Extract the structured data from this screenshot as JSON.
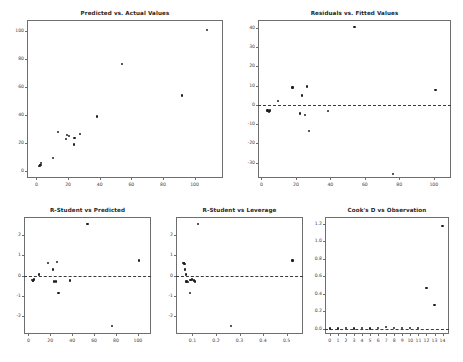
{
  "figure": {
    "background": "#ffffff",
    "marker_color": "#1f1f1f",
    "axis_color": "#6e6e6e",
    "refline_color": "#3a3a3a"
  },
  "chart_data": [
    {
      "id": "predicted-vs-actual",
      "type": "scatter",
      "title": "Predicted vs. Actual Values",
      "xlabel": "",
      "ylabel": "",
      "xlim": [
        -6,
        118
      ],
      "ylim": [
        -5,
        108
      ],
      "grid": false,
      "legend": null,
      "xticks": [
        0,
        20,
        40,
        60,
        80,
        100
      ],
      "yticks": [
        0,
        20,
        40,
        60,
        80,
        100
      ],
      "xticklabels": [
        "0",
        "20",
        "40",
        "60",
        "80",
        "100"
      ],
      "yticklabels": [
        "0",
        "20",
        "40",
        "60",
        "80",
        "100"
      ],
      "reference_line": null,
      "x": [
        1.5,
        2.0,
        2.5,
        3.0,
        10.5,
        13.5,
        18.5,
        19.5,
        20.5,
        23.5,
        24.0,
        27.5,
        38.5,
        54.0,
        92.0,
        108.0
      ],
      "y": [
        3.5,
        4.0,
        4.5,
        5.5,
        9.5,
        28.0,
        23.0,
        25.5,
        25.0,
        19.0,
        23.5,
        26.5,
        39.0,
        76.5,
        54.0,
        101.0
      ]
    },
    {
      "id": "residuals-vs-fitted",
      "type": "scatter",
      "title": "Residuals vs. Fitted Values",
      "xlabel": "",
      "ylabel": "",
      "xlim": [
        -2,
        110
      ],
      "ylim": [
        -38,
        44
      ],
      "grid": false,
      "legend": null,
      "xticks": [
        0,
        20,
        40,
        60,
        80,
        100
      ],
      "yticks": [
        -30,
        -20,
        -10,
        0,
        10,
        20,
        30,
        40
      ],
      "xticklabels": [
        "0",
        "20",
        "40",
        "60",
        "80",
        "100"
      ],
      "yticklabels": [
        "-30",
        "-20",
        "-10",
        "0",
        "10",
        "20",
        "30",
        "40"
      ],
      "reference_line": 0,
      "x": [
        3.5,
        4.0,
        4.5,
        5.0,
        9.5,
        18.0,
        22.5,
        23.5,
        25.5,
        26.5,
        27.5,
        38.5,
        54.0,
        76.5,
        101.0
      ],
      "y": [
        -3.0,
        -3.2,
        -3.5,
        -3.0,
        2.0,
        9.0,
        -4.5,
        4.8,
        -5.2,
        9.5,
        -13.5,
        -3.2,
        40.2,
        -36.0,
        7.8
      ]
    },
    {
      "id": "rstudent-vs-predicted",
      "type": "scatter",
      "title": "R-Student vs Predicted",
      "xlabel": "",
      "ylabel": "",
      "xlim": [
        -4,
        112
      ],
      "ylim": [
        -2.9,
        2.9
      ],
      "grid": false,
      "legend": null,
      "xticks": [
        0,
        20,
        40,
        60,
        80,
        100
      ],
      "yticks": [
        -2,
        -1,
        0,
        1,
        2
      ],
      "xticklabels": [
        "0",
        "20",
        "40",
        "60",
        "80",
        "100"
      ],
      "yticklabels": [
        "-2",
        "-1",
        "0",
        "1",
        "2"
      ],
      "reference_line": 0,
      "x": [
        3.5,
        4.0,
        4.5,
        5.5,
        9.5,
        18.0,
        22.5,
        23.5,
        25.0,
        26.5,
        27.5,
        38.0,
        54.0,
        76.5,
        101.0
      ],
      "y": [
        -0.22,
        -0.25,
        -0.28,
        -0.2,
        0.05,
        0.6,
        0.3,
        -0.3,
        -0.3,
        0.66,
        -0.88,
        -0.25,
        2.55,
        -2.5,
        0.74
      ]
    },
    {
      "id": "rstudent-vs-leverage",
      "type": "scatter",
      "title": "R-Student vs Leverage",
      "xlabel": "",
      "ylabel": "",
      "xlim": [
        0.03,
        0.57
      ],
      "ylim": [
        -2.9,
        2.9
      ],
      "grid": false,
      "legend": null,
      "xticks": [
        0.1,
        0.2,
        0.3,
        0.4,
        0.5
      ],
      "yticks": [
        -2,
        -1,
        0,
        1,
        2
      ],
      "xticklabels": [
        "0.1",
        "0.2",
        "0.3",
        "0.4",
        "0.5"
      ],
      "yticklabels": [
        "-2",
        "-1",
        "0",
        "1",
        "2"
      ],
      "reference_line": 0,
      "x": [
        0.062,
        0.064,
        0.066,
        0.068,
        0.072,
        0.075,
        0.082,
        0.088,
        0.092,
        0.098,
        0.105,
        0.112,
        0.122,
        0.265,
        0.525
      ],
      "y": [
        0.62,
        0.6,
        0.58,
        0.3,
        0.05,
        -0.3,
        -0.32,
        -0.88,
        -0.22,
        -0.2,
        -0.25,
        -0.3,
        2.55,
        -2.5,
        0.74
      ]
    },
    {
      "id": "cooks-d-vs-observation",
      "type": "scatter",
      "title": "Cook's D vs Observation",
      "xlabel": "",
      "ylabel": "",
      "xlim": [
        -0.6,
        14.8
      ],
      "ylim": [
        -0.06,
        1.28
      ],
      "grid": false,
      "legend": null,
      "xticks": [
        0,
        1,
        2,
        3,
        4,
        5,
        6,
        7,
        8,
        9,
        10,
        11,
        12,
        13,
        14
      ],
      "yticks": [
        0.0,
        0.2,
        0.4,
        0.6,
        0.8,
        1.0,
        1.2
      ],
      "xticklabels": [
        "0",
        "1",
        "2",
        "3",
        "4",
        "5",
        "6",
        "7",
        "8",
        "9",
        "10",
        "11",
        "12",
        "13",
        "14"
      ],
      "yticklabels": [
        "0.0",
        "0.2",
        "0.4",
        "0.6",
        "0.8",
        "1.0",
        "1.2"
      ],
      "reference_line": 0,
      "x": [
        0,
        1,
        2,
        3,
        4,
        5,
        6,
        7,
        8,
        9,
        10,
        11,
        12,
        13,
        14
      ],
      "y": [
        0.004,
        0.004,
        0.005,
        0.004,
        0.005,
        0.004,
        0.006,
        0.022,
        0.006,
        0.005,
        0.008,
        0.012,
        0.465,
        0.275,
        1.18
      ]
    }
  ]
}
